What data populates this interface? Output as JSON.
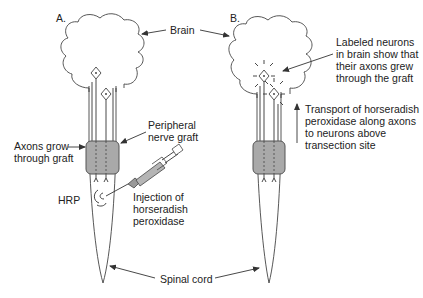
{
  "figure": {
    "panels": [
      {
        "id": "A",
        "label": "A."
      },
      {
        "id": "B",
        "label": "B."
      }
    ],
    "labels": {
      "brain": "Brain",
      "peripheral_graft": [
        "Peripheral",
        "nerve graft"
      ],
      "axons_grow": [
        "Axons grow",
        "through graft"
      ],
      "hrp": "HRP",
      "injection": [
        "Injection of",
        "horseradish",
        "peroxidase"
      ],
      "spinal_cord": "Spinal cord",
      "labeled_neurons": [
        "Labeled neurons",
        "in brain show that",
        "their axons grew",
        "through the graft"
      ],
      "transport": [
        "Transport of horseradish",
        "peroxidase along axons",
        "to neurons above",
        "transection site"
      ]
    },
    "colors": {
      "graft_fill": "#a9a9a9",
      "line": "#333333",
      "background": "#ffffff"
    }
  }
}
